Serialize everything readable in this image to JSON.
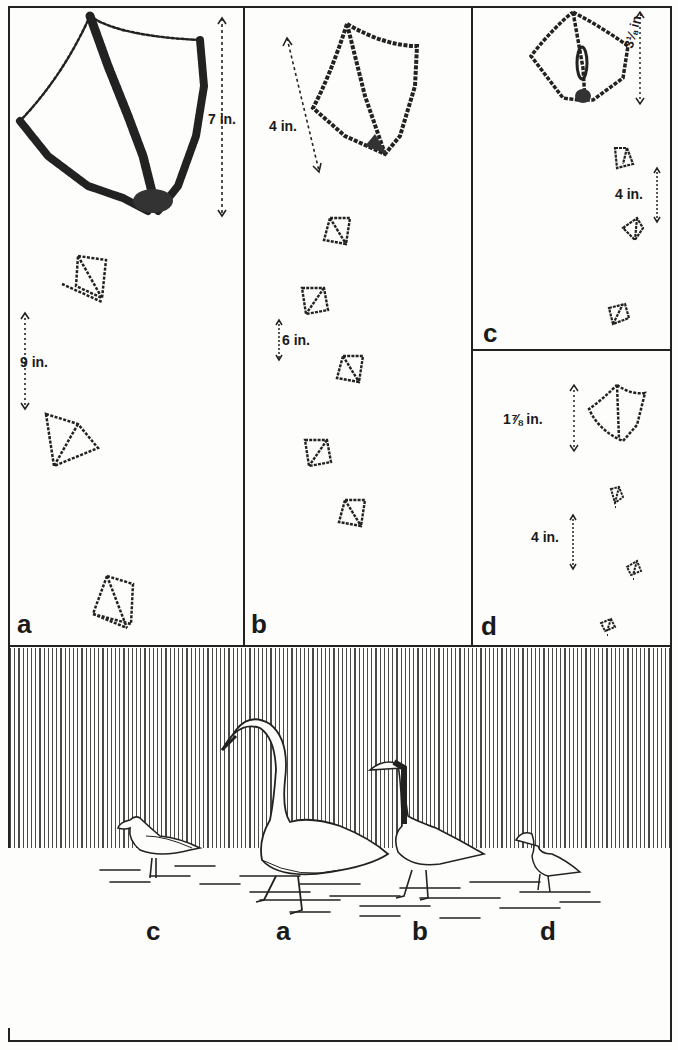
{
  "figure": {
    "panels": [
      {
        "id": "a",
        "label": "a",
        "measurements": [
          {
            "text": "7 in.",
            "type": "track-length"
          },
          {
            "text": "9 in.",
            "type": "stride"
          }
        ]
      },
      {
        "id": "b",
        "label": "b",
        "measurements": [
          {
            "text": "4 in.",
            "type": "track-length"
          },
          {
            "text": "6 in.",
            "type": "stride"
          }
        ]
      },
      {
        "id": "c",
        "label": "c",
        "measurements": [
          {
            "text": "3⅛ in.",
            "type": "track-length"
          },
          {
            "text": "4 in.",
            "type": "stride"
          }
        ]
      },
      {
        "id": "d",
        "label": "d",
        "measurements": [
          {
            "text": "1⅞ in.",
            "type": "track-length"
          },
          {
            "text": "4 in.",
            "type": "stride"
          }
        ]
      }
    ],
    "birds_scene": {
      "labels": [
        "c",
        "a",
        "b",
        "d"
      ],
      "birds": [
        {
          "label": "c",
          "description": "gull"
        },
        {
          "label": "a",
          "description": "swan"
        },
        {
          "label": "b",
          "description": "goose"
        },
        {
          "label": "d",
          "description": "duck"
        }
      ]
    },
    "colors": {
      "ink": "#1a1a1a",
      "paper": "#fdfdfb"
    }
  }
}
